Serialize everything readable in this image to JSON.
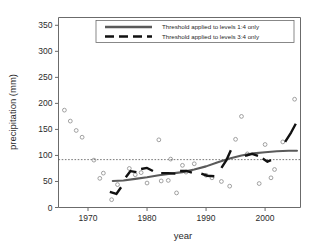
{
  "chart_data": {
    "type": "scatter",
    "title": "",
    "xlabel": "year",
    "ylabel": "precipitation (mm)",
    "xlim": [
      1965,
      2006
    ],
    "ylim": [
      0,
      365
    ],
    "grid": false,
    "xticks": [
      1970,
      1980,
      1990,
      2000
    ],
    "yticks": [
      0,
      50,
      100,
      150,
      200,
      250,
      300,
      350
    ],
    "legend_position": "top-center",
    "annotations": [
      {
        "name": "threshold-line",
        "type": "hline",
        "value": 92,
        "style": "dotted"
      }
    ],
    "series": [
      {
        "name": "annual precipitation observations",
        "type": "scatter",
        "marker": "open-circle",
        "color": "#8a8a8a",
        "points": [
          {
            "x": 1966,
            "y": 187
          },
          {
            "x": 1967,
            "y": 166
          },
          {
            "x": 1968,
            "y": 148
          },
          {
            "x": 1969,
            "y": 135
          },
          {
            "x": 1971,
            "y": 91
          },
          {
            "x": 1972,
            "y": 56
          },
          {
            "x": 1972.6,
            "y": 66
          },
          {
            "x": 1974,
            "y": 15
          },
          {
            "x": 1975,
            "y": 44
          },
          {
            "x": 1977,
            "y": 75
          },
          {
            "x": 1978,
            "y": 63
          },
          {
            "x": 1979,
            "y": 67
          },
          {
            "x": 1980,
            "y": 47
          },
          {
            "x": 1982,
            "y": 130
          },
          {
            "x": 1982.4,
            "y": 51
          },
          {
            "x": 1983.6,
            "y": 52
          },
          {
            "x": 1984,
            "y": 93
          },
          {
            "x": 1985,
            "y": 28
          },
          {
            "x": 1986,
            "y": 81
          },
          {
            "x": 1986.6,
            "y": 68
          },
          {
            "x": 1988,
            "y": 84
          },
          {
            "x": 1990,
            "y": 62
          },
          {
            "x": 1991,
            "y": 57
          },
          {
            "x": 1992.6,
            "y": 50
          },
          {
            "x": 1994,
            "y": 41
          },
          {
            "x": 1995,
            "y": 131
          },
          {
            "x": 1996,
            "y": 175
          },
          {
            "x": 1997,
            "y": 103
          },
          {
            "x": 1999,
            "y": 46
          },
          {
            "x": 2000,
            "y": 121
          },
          {
            "x": 2001,
            "y": 57
          },
          {
            "x": 2001.6,
            "y": 73
          },
          {
            "x": 2003,
            "y": 126
          },
          {
            "x": 2005,
            "y": 208
          }
        ]
      },
      {
        "name": "Threshold applied to levels 1:4 only",
        "type": "line",
        "style": "solid",
        "color": "#5a5a5a",
        "points": [
          {
            "x": 1974.2,
            "y": 51
          },
          {
            "x": 1976,
            "y": 52
          },
          {
            "x": 1978,
            "y": 55
          },
          {
            "x": 1980,
            "y": 58
          },
          {
            "x": 1982,
            "y": 62
          },
          {
            "x": 1984,
            "y": 65
          },
          {
            "x": 1986,
            "y": 68
          },
          {
            "x": 1988,
            "y": 73
          },
          {
            "x": 1990,
            "y": 79
          },
          {
            "x": 1992,
            "y": 87
          },
          {
            "x": 1994,
            "y": 94
          },
          {
            "x": 1996,
            "y": 100
          },
          {
            "x": 1998,
            "y": 104
          },
          {
            "x": 2000,
            "y": 106
          },
          {
            "x": 2002,
            "y": 108
          },
          {
            "x": 2004,
            "y": 109
          },
          {
            "x": 2005.4,
            "y": 109
          }
        ]
      },
      {
        "name": "Threshold applied to levels 3:4 only",
        "type": "line",
        "style": "dashed-segments",
        "color": "#111111",
        "segments": [
          [
            {
              "x": 1973.7,
              "y": 30
            },
            {
              "x": 1974.8,
              "y": 26
            },
            {
              "x": 1975.6,
              "y": 39
            }
          ],
          [
            {
              "x": 1976.4,
              "y": 58
            },
            {
              "x": 1977.2,
              "y": 70
            },
            {
              "x": 1978.2,
              "y": 68
            }
          ],
          [
            {
              "x": 1979.0,
              "y": 74
            },
            {
              "x": 1980.0,
              "y": 76
            },
            {
              "x": 1981.0,
              "y": 70
            }
          ],
          [
            {
              "x": 1982.4,
              "y": 66
            },
            {
              "x": 1983.6,
              "y": 66
            },
            {
              "x": 1984.8,
              "y": 65
            }
          ],
          [
            {
              "x": 1985.6,
              "y": 70
            },
            {
              "x": 1986.8,
              "y": 70
            },
            {
              "x": 1987.6,
              "y": 67
            }
          ],
          [
            {
              "x": 1989.2,
              "y": 65
            },
            {
              "x": 1990.2,
              "y": 61
            },
            {
              "x": 1991.4,
              "y": 60
            }
          ],
          [
            {
              "x": 1992.6,
              "y": 76
            },
            {
              "x": 1993.4,
              "y": 90
            },
            {
              "x": 1994.2,
              "y": 110
            }
          ],
          [
            {
              "x": 1996.6,
              "y": 99
            },
            {
              "x": 1997.8,
              "y": 103
            },
            {
              "x": 1998.8,
              "y": 99
            }
          ],
          [
            {
              "x": 1999.6,
              "y": 94
            },
            {
              "x": 2000.4,
              "y": 88
            },
            {
              "x": 2001.0,
              "y": 91
            }
          ],
          [
            {
              "x": 2003.4,
              "y": 126
            },
            {
              "x": 2004.4,
              "y": 144
            },
            {
              "x": 2005.2,
              "y": 161
            }
          ]
        ]
      }
    ],
    "legend_entries": [
      {
        "label": "Threshold applied to levels 1:4 only",
        "style": "solid"
      },
      {
        "label": "Threshold applied to levels 3:4 only",
        "style": "dashed"
      }
    ]
  }
}
